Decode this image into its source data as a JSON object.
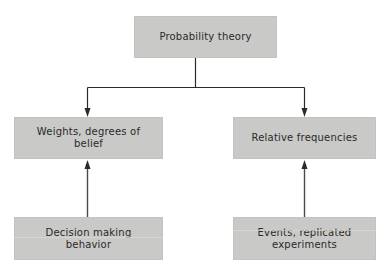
{
  "diagram": {
    "type": "flow-hierarchy",
    "colors": {
      "box_fill": "#c9c9c7",
      "text": "#2a2a2a",
      "line": "#2a2a2a",
      "background": "#ffffff"
    },
    "nodes": {
      "top": {
        "label": "Probability theory"
      },
      "left_mid": {
        "label": "Weights, degrees of\nbelief"
      },
      "right_mid": {
        "label": "Relative frequencies"
      },
      "left_bottom": {
        "label": "Decision making\nbehavior"
      },
      "right_bottom": {
        "label": "Events, replicated\nexperiments"
      }
    },
    "edges": [
      {
        "from": "top",
        "to": "left_mid",
        "direction": "down"
      },
      {
        "from": "top",
        "to": "right_mid",
        "direction": "down"
      },
      {
        "from": "left_bottom",
        "to": "left_mid",
        "direction": "up"
      },
      {
        "from": "right_bottom",
        "to": "right_mid",
        "direction": "up"
      }
    ]
  }
}
